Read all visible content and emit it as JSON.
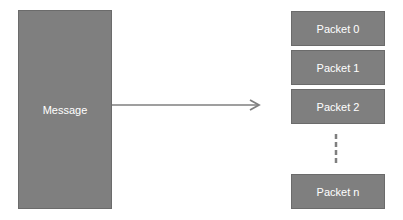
{
  "message": {
    "label": "Message"
  },
  "packets": [
    {
      "label": "Packet 0"
    },
    {
      "label": "Packet 1"
    },
    {
      "label": "Packet 2"
    },
    {
      "label": "Packet n"
    }
  ],
  "colors": {
    "box_fill": "#7f7f7f",
    "box_border": "#6b6b6b",
    "arrow": "#7f7f7f",
    "text": "#ffffff"
  }
}
